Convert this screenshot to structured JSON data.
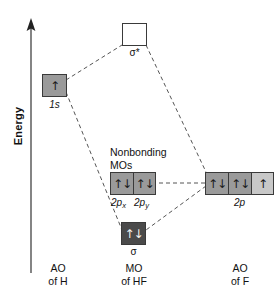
{
  "axis": {
    "label": "Energy",
    "direction": "up"
  },
  "colors": {
    "box_border": "#3a3a3a",
    "fill_empty": "#ffffff",
    "fill_medium": "#9a9a9a",
    "fill_light": "#c8c8c8",
    "fill_dark": "#4a4a4a",
    "line": "#555555",
    "text": "#111111"
  },
  "orbitals": {
    "antibonding": {
      "name": "sigma-star",
      "label": "σ*",
      "spins": "",
      "fill": "empty",
      "electrons": 0
    },
    "hydrogen_1s": {
      "name": "1s",
      "label": "1s",
      "spins": "↑",
      "fill": "medium",
      "electrons": 1
    },
    "nonbonding": {
      "title": "Nonbonding\nMOs",
      "boxes": [
        {
          "label_main": "2p",
          "label_sub": "x",
          "spins": "↑↓",
          "fill": "medium",
          "electrons": 2
        },
        {
          "label_main": "2p",
          "label_sub": "y",
          "spins": "↑↓",
          "fill": "medium",
          "electrons": 2
        }
      ]
    },
    "bonding": {
      "name": "sigma",
      "label": "σ",
      "spins": "↑↓",
      "fill": "dark",
      "electrons": 2
    },
    "fluorine_2p": {
      "label": "2p",
      "boxes": [
        {
          "spins": "↑↓",
          "fill": "medium",
          "electrons": 2
        },
        {
          "spins": "↑↓",
          "fill": "medium",
          "electrons": 2
        },
        {
          "spins": "↑",
          "fill": "light",
          "electrons": 1
        }
      ]
    }
  },
  "captions": {
    "left": "AO\nof H",
    "center": "MO\nof HF",
    "right": "AO\nof F"
  }
}
